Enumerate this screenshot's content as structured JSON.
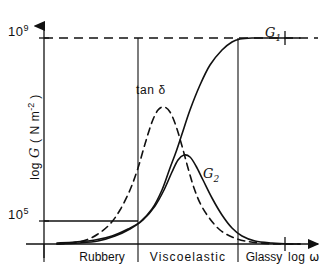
{
  "chart_data": {
    "type": "line",
    "title": "",
    "xlabel": "log ω",
    "ylabel": "log 𝐺 ( N m⁻² )",
    "ylabel_parts": {
      "prefix": "log ",
      "symbol": "G",
      "units_open": " ( N m",
      "units_exp": "-2",
      "units_close": " )"
    },
    "xlabel_parts": {
      "prefix": "log ",
      "symbol": "ω"
    },
    "grid": false,
    "legend_position": "inline-annotations",
    "y_ticks": [
      {
        "label": "10⁹",
        "mantissa": "10",
        "exponent": "9",
        "value": 1000000000,
        "y_px": 38,
        "line_style": "dashed"
      },
      {
        "label": "10⁵",
        "mantissa": "10",
        "exponent": "5",
        "value": 100000,
        "y_px": 221,
        "line_style": "solid"
      }
    ],
    "x_regions": [
      {
        "label": "Rubbery",
        "start_px": 57,
        "end_px": 138
      },
      {
        "label": "Viscoelastic",
        "start_px": 138,
        "end_px": 238
      },
      {
        "label": "Glassy",
        "start_px": 238,
        "end_px": 300
      }
    ],
    "series": [
      {
        "name": "G1",
        "display_label": "G₁",
        "base": "G",
        "subscript": "1",
        "style": "solid",
        "color": "#111111",
        "description": "storage modulus: sigmoidal rise from 10^5 plateau to 10^9 glassy plateau",
        "points": [
          [
            57,
            243
          ],
          [
            75,
            242
          ],
          [
            95,
            240
          ],
          [
            112,
            236
          ],
          [
            128,
            229
          ],
          [
            140,
            222
          ],
          [
            152,
            209
          ],
          [
            162,
            190
          ],
          [
            170,
            168
          ],
          [
            176,
            152
          ],
          [
            182,
            134
          ],
          [
            190,
            110
          ],
          [
            200,
            85
          ],
          [
            210,
            65
          ],
          [
            222,
            50
          ],
          [
            232,
            42
          ],
          [
            240,
            39
          ],
          [
            252,
            38
          ],
          [
            270,
            38
          ],
          [
            300,
            38
          ]
        ]
      },
      {
        "name": "G2",
        "display_label": "G₂",
        "base": "G",
        "subscript": "2",
        "style": "solid",
        "color": "#111111",
        "description": "loss modulus: broad peak within viscoelastic region then decay",
        "points": [
          [
            57,
            244
          ],
          [
            78,
            243
          ],
          [
            98,
            241
          ],
          [
            115,
            236
          ],
          [
            130,
            229
          ],
          [
            143,
            220
          ],
          [
            155,
            206
          ],
          [
            164,
            190
          ],
          [
            172,
            172
          ],
          [
            178,
            160
          ],
          [
            184,
            155
          ],
          [
            190,
            157
          ],
          [
            196,
            166
          ],
          [
            203,
            180
          ],
          [
            212,
            198
          ],
          [
            222,
            215
          ],
          [
            232,
            228
          ],
          [
            242,
            236
          ],
          [
            255,
            241
          ],
          [
            272,
            243
          ],
          [
            290,
            244
          ],
          [
            300,
            244
          ]
        ]
      },
      {
        "name": "tan_delta",
        "display_label": "tan δ",
        "base": "tan ",
        "subscript": "",
        "style": "dashed",
        "color": "#111111",
        "description": "loss tangent: sharp peak before the modulus crossover",
        "points": [
          [
            57,
            244
          ],
          [
            72,
            243
          ],
          [
            86,
            240
          ],
          [
            98,
            234
          ],
          [
            110,
            224
          ],
          [
            120,
            210
          ],
          [
            130,
            190
          ],
          [
            138,
            168
          ],
          [
            145,
            144
          ],
          [
            152,
            122
          ],
          [
            158,
            110
          ],
          [
            164,
            107
          ],
          [
            170,
            112
          ],
          [
            176,
            126
          ],
          [
            182,
            146
          ],
          [
            188,
            168
          ],
          [
            194,
            188
          ],
          [
            201,
            205
          ],
          [
            210,
            219
          ],
          [
            220,
            230
          ],
          [
            232,
            237
          ],
          [
            245,
            241
          ],
          [
            260,
            243
          ],
          [
            278,
            244
          ],
          [
            300,
            244
          ]
        ]
      }
    ],
    "annotations": [
      {
        "name": "tan-delta",
        "text": "tan δ",
        "x_px": 136,
        "y_px": 84
      },
      {
        "name": "G1",
        "text": "G₁",
        "x_px": 265,
        "y_px": 24
      },
      {
        "name": "G2",
        "text": "G₂",
        "x_px": 203,
        "y_px": 165
      }
    ],
    "axes": {
      "x_axis_y_px": 244,
      "y_axis_x_px": 44,
      "x_axis_end_px": 325,
      "y_axis_top_px": 18,
      "x_tick_px": [
        285
      ],
      "arrowheads": [
        "x-right",
        "y-up"
      ]
    }
  },
  "chart": {
    "y_tick_top_mantissa": "10",
    "y_tick_top_exponent": "9",
    "y_tick_bottom_mantissa": "10",
    "y_tick_bottom_exponent": "5",
    "y_axis_title_prefix": "log ",
    "y_axis_title_symbol": "G",
    "y_axis_title_units": " ( N m",
    "y_axis_title_units_exp": "-2",
    "y_axis_title_units_end": " )",
    "x_axis_title_prefix": "log ",
    "x_axis_title_symbol": "ω",
    "tan_delta_label": "tan δ",
    "g1_symbol": "G",
    "g1_subscript": "1",
    "g2_symbol": "G",
    "g2_subscript": "2",
    "region_rubbery": "Rubbery",
    "region_viscoelastic": "Viscoelastic",
    "region_glassy": "Glassy",
    "stroke_color": "#111111",
    "background_color": "#ffffff"
  }
}
